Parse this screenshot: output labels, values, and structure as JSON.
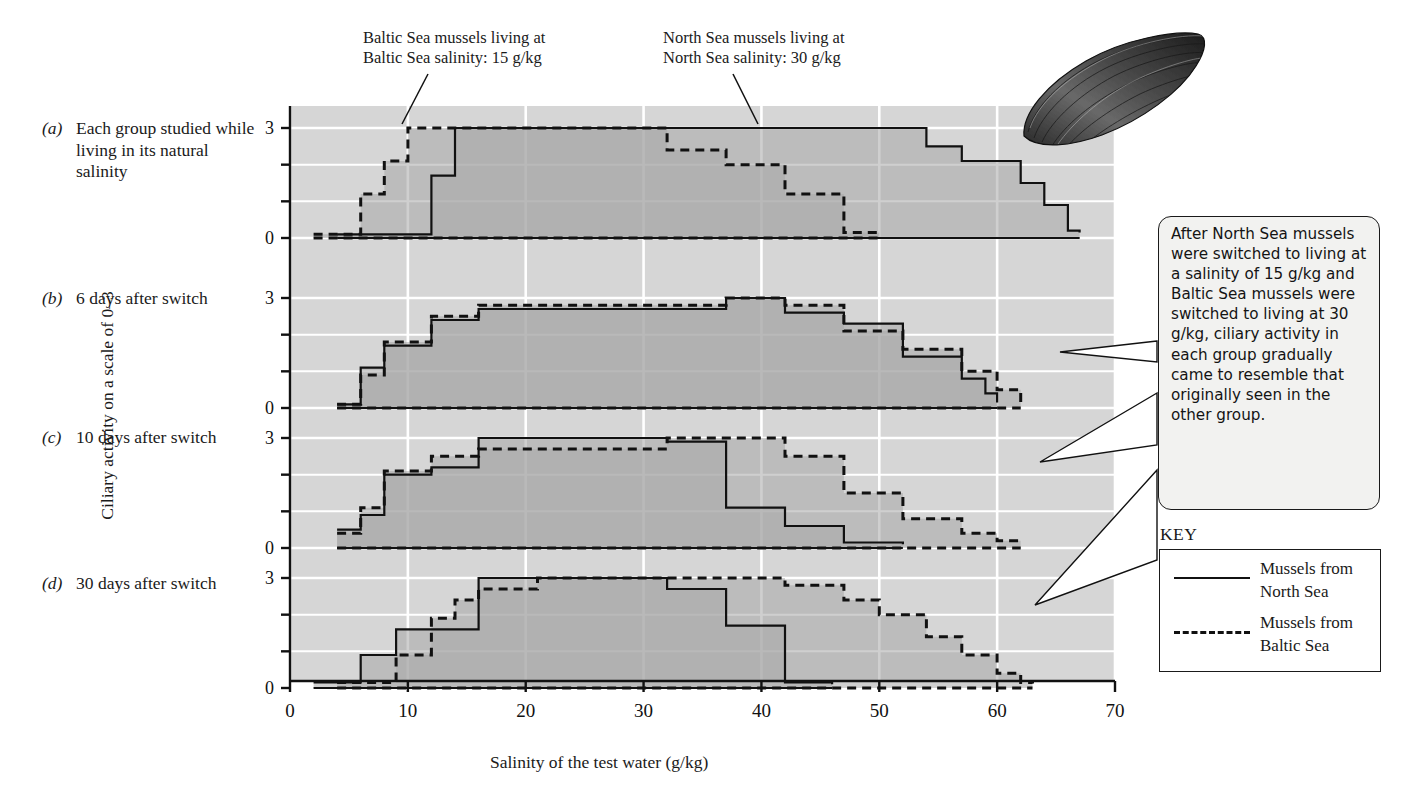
{
  "figure": {
    "y_axis_title": "Ciliary activity on a scale of 0–3",
    "x_axis_title": "Salinity of the test water (g/kg)"
  },
  "annotations": {
    "baltic_note": "Baltic Sea mussels living at\nBaltic Sea salinity: 15 g/kg",
    "north_note": "North Sea mussels living at\nNorth Sea salinity: 30 g/kg",
    "callout": "After North Sea mussels were switched to living at a salinity of 15 g/kg and Baltic Sea mussels were switched to living at 30 g/kg, ciliary activity in each group gradually came to resemble that originally seen in the other group."
  },
  "panels": [
    {
      "tag": "(a)",
      "label": "Each group studied while living in its natural salinity"
    },
    {
      "tag": "(b)",
      "label": "6 days after switch"
    },
    {
      "tag": "(c)",
      "label": "10 days after switch"
    },
    {
      "tag": "(d)",
      "label": "30 days after switch"
    }
  ],
  "key": {
    "title": "KEY",
    "items": [
      {
        "style": "solid",
        "label": "Mussels from\nNorth Sea"
      },
      {
        "style": "dashed",
        "label": "Mussels from\nBaltic Sea"
      }
    ]
  },
  "colors": {
    "plot_background": "#d6d6d6",
    "fill_overlap": "#a8a8a8",
    "gridline": "#ffffff",
    "line": "#111111",
    "callout_background": "#f2f2f0"
  },
  "chart_data": {
    "type": "line",
    "xlabel": "Salinity of the test water (g/kg)",
    "ylabel": "Ciliary activity on a scale of 0–3",
    "xlim": [
      0,
      70
    ],
    "ylim": [
      0,
      3
    ],
    "xticks": [
      0,
      10,
      20,
      30,
      40,
      50,
      60,
      70
    ],
    "yticks": [
      0,
      1,
      2,
      3
    ],
    "grid": true,
    "legend": [
      "Mussels from North Sea",
      "Mussels from Baltic Sea"
    ],
    "interpolation": "step-post",
    "panels": [
      {
        "tag": "(a)",
        "label": "Each group studied while living in its natural salinity",
        "series": [
          {
            "name": "Mussels from North Sea",
            "style": "solid",
            "x": [
              4,
              6,
              8,
              10,
              12,
              14,
              37,
              42,
              47,
              52,
              54,
              57,
              62,
              64,
              66,
              67
            ],
            "y": [
              0.1,
              0.1,
              0.1,
              0.1,
              1.7,
              3.0,
              3.0,
              3.0,
              3.0,
              3.0,
              2.5,
              2.1,
              1.5,
              0.9,
              0.2,
              0.15
            ]
          },
          {
            "name": "Mussels from Baltic Sea",
            "style": "dashed",
            "x": [
              2,
              4,
              6,
              8,
              10,
              12,
              27,
              32,
              37,
              42,
              47,
              50
            ],
            "y": [
              0.1,
              0.1,
              1.2,
              2.1,
              3.0,
              3.0,
              3.0,
              2.4,
              2.0,
              1.2,
              0.15,
              0.1
            ]
          }
        ]
      },
      {
        "tag": "(b)",
        "label": "6 days after switch",
        "series": [
          {
            "name": "Mussels from North Sea",
            "style": "solid",
            "x": [
              4,
              6,
              8,
              12,
              16,
              37,
              42,
              47,
              52,
              57,
              59,
              60
            ],
            "y": [
              0.1,
              1.1,
              1.7,
              2.4,
              2.7,
              3.0,
              2.6,
              2.3,
              1.4,
              0.8,
              0.4,
              0.15
            ]
          },
          {
            "name": "Mussels from Baltic Sea",
            "style": "dashed",
            "x": [
              4,
              6,
              8,
              12,
              16,
              37,
              42,
              47,
              52,
              57,
              60,
              62
            ],
            "y": [
              0.1,
              0.9,
              1.8,
              2.5,
              2.8,
              3.0,
              2.8,
              2.1,
              1.6,
              1.0,
              0.5,
              0.15
            ]
          }
        ]
      },
      {
        "tag": "(c)",
        "label": "10 days after switch",
        "series": [
          {
            "name": "Mussels from North Sea",
            "style": "solid",
            "x": [
              4,
              6,
              8,
              12,
              16,
              27,
              32,
              37,
              42,
              47,
              52
            ],
            "y": [
              0.5,
              0.9,
              2.0,
              2.2,
              3.0,
              3.0,
              2.9,
              1.1,
              0.6,
              0.15,
              0.1
            ]
          },
          {
            "name": "Mussels from Baltic Sea",
            "style": "dashed",
            "x": [
              4,
              6,
              8,
              12,
              16,
              32,
              37,
              42,
              47,
              52,
              57,
              60,
              62
            ],
            "y": [
              0.4,
              1.1,
              2.1,
              2.5,
              2.7,
              3.0,
              3.0,
              2.5,
              1.5,
              0.8,
              0.4,
              0.2,
              0.15
            ]
          }
        ]
      },
      {
        "tag": "(d)",
        "label": "30 days after switch",
        "series": [
          {
            "name": "Mussels from North Sea",
            "style": "solid",
            "x": [
              2,
              4,
              6,
              9,
              12,
              16,
              21,
              27,
              32,
              37,
              42,
              46
            ],
            "y": [
              0.15,
              0.15,
              0.9,
              1.6,
              1.6,
              3.0,
              3.0,
              3.0,
              2.7,
              1.7,
              0.15,
              0.1
            ]
          },
          {
            "name": "Mussels from Baltic Sea",
            "style": "dashed",
            "x": [
              4,
              6,
              9,
              12,
              14,
              16,
              21,
              37,
              42,
              47,
              50,
              54,
              57,
              60,
              62,
              63
            ],
            "y": [
              0.15,
              0.15,
              0.9,
              1.9,
              2.4,
              2.7,
              3.0,
              3.0,
              2.8,
              2.4,
              2.0,
              1.4,
              0.9,
              0.4,
              0.15,
              0.12
            ]
          }
        ]
      }
    ]
  }
}
